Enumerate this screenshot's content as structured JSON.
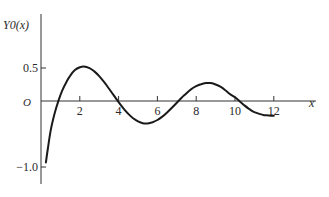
{
  "chart_data": {
    "type": "line",
    "title": "",
    "ylabel": "Y0(x)",
    "xlabel": "x",
    "origin_label": "O",
    "xlim": [
      0,
      14
    ],
    "ylim": [
      -1.1,
      0.8
    ],
    "x_ticks": [
      2,
      4,
      6,
      8,
      10,
      12
    ],
    "x_tick_labels": [
      "2",
      "4",
      "6",
      "8",
      "10",
      "12"
    ],
    "y_ticks": [
      0.5,
      -1.0
    ],
    "y_tick_labels": [
      "0.5",
      "−1.0"
    ],
    "grid": false,
    "legend": null,
    "series": [
      {
        "name": "Y0(x)",
        "color": "#1a1a1a",
        "x": [
          0.25,
          0.35,
          0.5,
          0.7,
          0.9,
          1.1,
          1.3,
          1.5,
          1.75,
          2.0,
          2.2,
          2.5,
          2.75,
          3.0,
          3.25,
          3.5,
          3.75,
          4.0,
          4.25,
          4.5,
          4.75,
          5.0,
          5.25,
          5.5,
          5.75,
          6.0,
          6.25,
          6.5,
          6.75,
          7.0,
          7.25,
          7.5,
          7.75,
          8.0,
          8.25,
          8.5,
          8.75,
          9.0,
          9.25,
          9.5,
          9.75,
          10.0,
          10.25,
          10.5,
          10.75,
          11.0,
          11.25,
          11.5,
          11.75,
          12.0
        ],
        "y": [
          -0.931,
          -0.727,
          -0.445,
          -0.191,
          0.006,
          0.162,
          0.282,
          0.382,
          0.468,
          0.51,
          0.521,
          0.498,
          0.448,
          0.377,
          0.289,
          0.189,
          0.085,
          -0.017,
          -0.111,
          -0.195,
          -0.262,
          -0.309,
          -0.337,
          -0.339,
          -0.322,
          -0.288,
          -0.237,
          -0.173,
          -0.102,
          -0.026,
          0.05,
          0.118,
          0.181,
          0.224,
          0.255,
          0.272,
          0.271,
          0.25,
          0.216,
          0.164,
          0.104,
          0.056,
          -0.007,
          -0.07,
          -0.124,
          -0.169,
          -0.196,
          -0.215,
          -0.219,
          -0.225
        ]
      }
    ]
  }
}
